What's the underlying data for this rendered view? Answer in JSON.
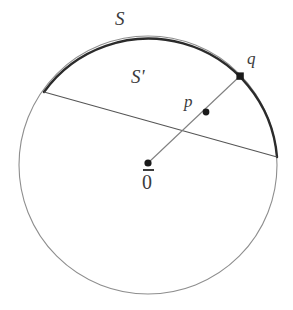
{
  "figure": {
    "domain": "diagram",
    "type": "geometric-circle-diagram",
    "canvas": {
      "width": 293,
      "height": 310,
      "background": "#ffffff"
    },
    "colors": {
      "circle_stroke": "#8e8e8e",
      "arc_stroke": "#2b2b2b",
      "chord_stroke": "#555555",
      "ray_stroke": "#777777",
      "point_fill": "#1a1a1a",
      "label_color": "#3c3c3c"
    },
    "circle": {
      "cx": 148,
      "cy": 165,
      "r": 129
    },
    "arc_S": {
      "start_x": 44,
      "start_y": 92,
      "end_x": 277,
      "end_y": 157
    },
    "chord_Sprime": {
      "x1": 44,
      "y1": 92,
      "x2": 277,
      "y2": 157
    },
    "ray": {
      "x1": 148,
      "y1": 163,
      "x2": 240,
      "y2": 76
    },
    "points": [
      {
        "id": "origin",
        "x": 148,
        "y": 163,
        "r": 3.6,
        "shape": "circle"
      },
      {
        "id": "p",
        "x": 206,
        "y": 112,
        "r": 3.4,
        "shape": "circle"
      },
      {
        "id": "q",
        "x": 240,
        "y": 76,
        "r": 3.8,
        "shape": "square"
      }
    ],
    "labels": {
      "arc": "S",
      "chord": "S'",
      "point_q": "q",
      "point_p": "p",
      "origin": "0"
    }
  }
}
